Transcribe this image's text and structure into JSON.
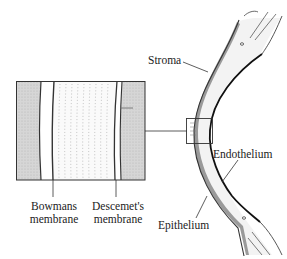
{
  "diagram": {
    "labels": {
      "stroma": "Stroma",
      "bowmans_line1": "Bowmans",
      "bowmans_line2": "membrane",
      "descemets_line1": "Descemet's",
      "descemets_line2": "membrane",
      "endothelium": "Endothelium",
      "epithelium": "Epithelium"
    },
    "colors": {
      "line": "#1a1a1a",
      "shade": "#d4d4d4",
      "stroma_fill": "#f4f4f4",
      "dots": "#9a9a9a"
    }
  }
}
